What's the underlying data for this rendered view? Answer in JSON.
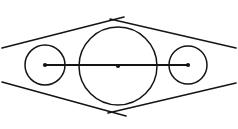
{
  "figure": {
    "type": "geometry-diagram",
    "canvas": {
      "width": 238,
      "height": 129,
      "background": "#ffffff"
    },
    "stroke_color": "#141414",
    "dot_color": "#141414"
  },
  "chart_data": {
    "type": "scatter",
    "xlabel": "",
    "ylabel": "",
    "xlim": [
      0,
      238
    ],
    "ylim": [
      0,
      129
    ],
    "grid": false,
    "legend": "none",
    "circles": [
      {
        "name": "left-circle",
        "cx": 45,
        "cy": 65,
        "r": 20,
        "stroke_width": 1.5
      },
      {
        "name": "center-circle",
        "cx": 118,
        "cy": 66,
        "r": 39,
        "stroke_width": 1.5
      },
      {
        "name": "right-circle",
        "cx": 188,
        "cy": 65,
        "r": 19,
        "stroke_width": 1.5
      }
    ],
    "center_points": [
      {
        "name": "left-center",
        "x": 45,
        "y": 65
      },
      {
        "name": "middle-center",
        "x": 118,
        "y": 66
      },
      {
        "name": "right-center",
        "x": 188,
        "y": 65
      }
    ],
    "axis_segment": {
      "name": "center-axis",
      "x1": 45,
      "y1": 65,
      "x2": 188,
      "y2": 65,
      "stroke_width": 1.8
    },
    "tangent_lines": [
      {
        "name": "tangent-upper-left",
        "x1": 2,
        "y1": 48,
        "x2": 124,
        "y2": 17,
        "stroke_width": 1.6
      },
      {
        "name": "tangent-upper-right",
        "x1": 110,
        "y1": 19,
        "x2": 236,
        "y2": 48,
        "stroke_width": 1.6
      },
      {
        "name": "tangent-lower-left",
        "x1": 2,
        "y1": 82,
        "x2": 126,
        "y2": 116,
        "stroke_width": 1.6
      },
      {
        "name": "tangent-lower-right",
        "x1": 108,
        "y1": 113,
        "x2": 236,
        "y2": 83,
        "stroke_width": 1.6
      }
    ],
    "crossings": [
      {
        "name": "top-crossing",
        "x": 117,
        "y": 18
      },
      {
        "name": "bottom-crossing",
        "x": 117,
        "y": 114
      }
    ],
    "dot_radius": 2.1
  }
}
